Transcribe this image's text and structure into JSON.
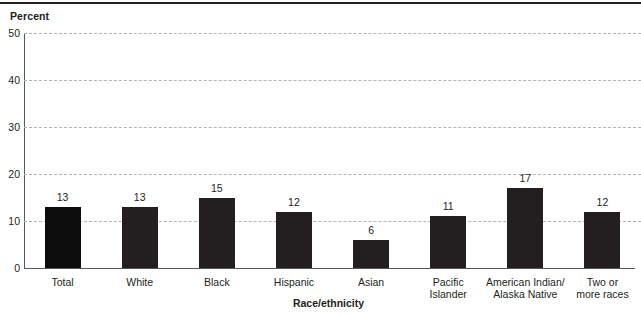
{
  "chart_data": {
    "type": "bar",
    "title": "",
    "ylabel": "Percent",
    "xlabel": "Race/ethnicity",
    "ylim": [
      0,
      50
    ],
    "yticks": [
      0,
      10,
      20,
      30,
      40,
      50
    ],
    "grid": "horizontal-dashed",
    "legend": "none",
    "categories": [
      "Total",
      "White",
      "Black",
      "Hispanic",
      "Asian",
      "Pacific Islander",
      "American Indian/ Alaska Native",
      "Two or more races"
    ],
    "category_lines": [
      [
        "Total"
      ],
      [
        "White"
      ],
      [
        "Black"
      ],
      [
        "Hispanic"
      ],
      [
        "Asian"
      ],
      [
        "Pacific",
        "Islander"
      ],
      [
        "American Indian/",
        "Alaska Native"
      ],
      [
        "Two or",
        "more races"
      ]
    ],
    "values": [
      13,
      13,
      15,
      12,
      6,
      11,
      17,
      12
    ],
    "value_labels": [
      "13",
      "13",
      "15",
      "12",
      "6",
      "11",
      "17",
      "12"
    ],
    "bar_colors": [
      "#0c0c0c",
      "#231f20",
      "#231f20",
      "#231f20",
      "#231f20",
      "#231f20",
      "#231f20",
      "#231f20"
    ],
    "colors": {
      "bar": "#231f20",
      "bar_highlight": "#0c0c0c",
      "grid": "#b4b4b4",
      "axis": "#58595b",
      "text": "#231f20",
      "background": "#ffffff",
      "top_rule": "#231f20"
    }
  },
  "axis": {
    "y_title": "Percent",
    "x_title": "Race/ethnicity",
    "y_tick_labels": [
      "50",
      "40",
      "30",
      "20",
      "10",
      "0"
    ]
  }
}
